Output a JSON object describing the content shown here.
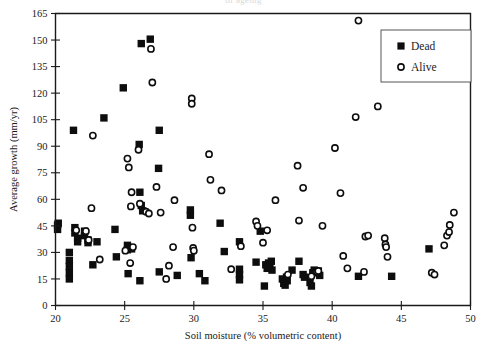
{
  "figure": {
    "top_bleed_text": "of ageing",
    "background": "#ffffff",
    "ink_color": "#0d0d0d"
  },
  "legend": {
    "entries": [
      {
        "label": "Dead",
        "marker": "filled-square"
      },
      {
        "label": "Alive",
        "marker": "open-circle"
      }
    ]
  },
  "chart_data": {
    "type": "scatter",
    "title": "",
    "xlabel": "Soil moisture (% volumetric content)",
    "ylabel": "Average growth (mm/yr)",
    "xlim": [
      20,
      50
    ],
    "ylim": [
      0,
      165
    ],
    "xticks": [
      20,
      25,
      30,
      35,
      40,
      45,
      50
    ],
    "yticks": [
      0,
      15,
      30,
      45,
      60,
      75,
      90,
      105,
      120,
      135,
      150,
      165
    ],
    "grid": false,
    "legend_position": "top-right",
    "series": [
      {
        "name": "Dead",
        "marker": "filled-square",
        "color": "#0d0d0d",
        "points": [
          [
            20.15,
            45.5
          ],
          [
            20.15,
            43.0
          ],
          [
            20.2,
            46.5
          ],
          [
            21.0,
            30.0
          ],
          [
            21.0,
            25.5
          ],
          [
            21.0,
            22.0
          ],
          [
            21.0,
            18.5
          ],
          [
            21.0,
            15.0
          ],
          [
            21.3,
            99.0
          ],
          [
            21.4,
            44.0
          ],
          [
            21.4,
            41.0
          ],
          [
            21.6,
            38.0
          ],
          [
            21.6,
            36.0
          ],
          [
            22.1,
            42.0
          ],
          [
            22.1,
            39.5
          ],
          [
            22.35,
            37.0
          ],
          [
            22.35,
            35.5
          ],
          [
            22.7,
            23.0
          ],
          [
            23.0,
            36.0
          ],
          [
            23.5,
            106.0
          ],
          [
            24.3,
            43.0
          ],
          [
            24.4,
            27.5
          ],
          [
            24.9,
            123.0
          ],
          [
            25.2,
            34.0
          ],
          [
            25.2,
            31.5
          ],
          [
            25.25,
            18.0
          ],
          [
            25.5,
            32.0
          ],
          [
            26.05,
            91.0
          ],
          [
            26.1,
            64.0
          ],
          [
            26.2,
            56.5
          ],
          [
            26.3,
            53.5
          ],
          [
            26.1,
            14.0
          ],
          [
            26.2,
            148.0
          ],
          [
            26.85,
            150.5
          ],
          [
            27.45,
            77.5
          ],
          [
            27.5,
            99.0
          ],
          [
            27.5,
            19.0
          ],
          [
            28.8,
            17.0
          ],
          [
            29.75,
            54.0
          ],
          [
            29.75,
            51.0
          ],
          [
            29.8,
            27.0
          ],
          [
            30.4,
            18.0
          ],
          [
            30.8,
            14.0
          ],
          [
            31.9,
            46.5
          ],
          [
            32.2,
            30.5
          ],
          [
            33.3,
            36.0
          ],
          [
            33.3,
            20.5
          ],
          [
            33.3,
            17.5
          ],
          [
            33.3,
            14.5
          ],
          [
            34.5,
            24.5
          ],
          [
            34.8,
            42.0
          ],
          [
            35.1,
            11.0
          ],
          [
            35.2,
            23.0
          ],
          [
            35.3,
            21.0
          ],
          [
            35.4,
            24.0
          ],
          [
            35.5,
            22.5
          ],
          [
            35.6,
            25.0
          ],
          [
            35.65,
            20.0
          ],
          [
            36.4,
            15.0
          ],
          [
            36.5,
            12.5
          ],
          [
            36.6,
            11.5
          ],
          [
            36.7,
            16.0
          ],
          [
            36.75,
            14.0
          ],
          [
            37.1,
            20.0
          ],
          [
            37.6,
            25.0
          ],
          [
            37.9,
            17.5
          ],
          [
            38.0,
            16.0
          ],
          [
            38.4,
            13.0
          ],
          [
            38.5,
            11.0
          ],
          [
            38.6,
            18.5
          ],
          [
            38.7,
            20.0
          ],
          [
            39.0,
            19.5
          ],
          [
            39.1,
            17.0
          ],
          [
            41.9,
            16.5
          ],
          [
            44.3,
            16.5
          ],
          [
            47.0,
            32.0
          ]
        ]
      },
      {
        "name": "Alive",
        "marker": "open-circle",
        "color": "#0d0d0d",
        "points": [
          [
            21.5,
            42.5
          ],
          [
            22.2,
            42.0
          ],
          [
            22.4,
            37.0
          ],
          [
            22.6,
            55.0
          ],
          [
            22.7,
            96.0
          ],
          [
            23.2,
            26.0
          ],
          [
            25.05,
            31.0
          ],
          [
            25.2,
            83.0
          ],
          [
            25.3,
            78.0
          ],
          [
            25.4,
            24.0
          ],
          [
            25.45,
            56.0
          ],
          [
            25.5,
            64.0
          ],
          [
            25.6,
            33.0
          ],
          [
            26.0,
            88.0
          ],
          [
            26.1,
            57.5
          ],
          [
            26.55,
            53.0
          ],
          [
            26.75,
            52.0
          ],
          [
            26.9,
            145.0
          ],
          [
            27.0,
            126.0
          ],
          [
            27.3,
            67.0
          ],
          [
            27.6,
            52.5
          ],
          [
            28.0,
            15.0
          ],
          [
            28.2,
            22.5
          ],
          [
            28.5,
            33.0
          ],
          [
            28.6,
            59.5
          ],
          [
            29.85,
            117.0
          ],
          [
            29.85,
            114.0
          ],
          [
            29.9,
            44.0
          ],
          [
            29.95,
            32.5
          ],
          [
            30.0,
            31.0
          ],
          [
            31.1,
            85.5
          ],
          [
            31.2,
            71.0
          ],
          [
            32.0,
            65.0
          ],
          [
            32.7,
            20.5
          ],
          [
            33.4,
            33.5
          ],
          [
            34.5,
            47.5
          ],
          [
            34.6,
            45.0
          ],
          [
            35.0,
            35.5
          ],
          [
            35.3,
            42.5
          ],
          [
            35.9,
            59.5
          ],
          [
            36.8,
            17.5
          ],
          [
            37.5,
            79.0
          ],
          [
            37.6,
            48.0
          ],
          [
            37.9,
            66.5
          ],
          [
            38.5,
            16.5
          ],
          [
            38.9,
            19.0
          ],
          [
            39.0,
            19.5
          ],
          [
            39.3,
            45.0
          ],
          [
            40.2,
            89.0
          ],
          [
            40.6,
            63.5
          ],
          [
            40.8,
            28.0
          ],
          [
            41.1,
            21.0
          ],
          [
            41.7,
            106.5
          ],
          [
            41.9,
            161.0
          ],
          [
            42.3,
            19.0
          ],
          [
            42.4,
            39.0
          ],
          [
            42.6,
            39.5
          ],
          [
            43.3,
            112.5
          ],
          [
            43.8,
            38.0
          ],
          [
            43.85,
            34.5
          ],
          [
            43.9,
            33.0
          ],
          [
            44.0,
            27.5
          ],
          [
            47.2,
            18.5
          ],
          [
            47.4,
            17.5
          ],
          [
            48.1,
            34.0
          ],
          [
            48.3,
            39.5
          ],
          [
            48.45,
            41.5
          ],
          [
            48.5,
            45.5
          ],
          [
            48.8,
            52.5
          ]
        ]
      }
    ]
  }
}
